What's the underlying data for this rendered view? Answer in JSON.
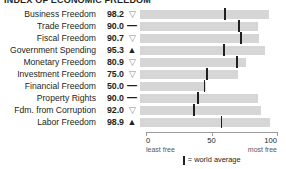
{
  "chart_data": {
    "type": "bar",
    "title": "INDEX OF ECONOMIC FREEDOM",
    "xlabel": "",
    "ylabel": "",
    "xlim": [
      0,
      100
    ],
    "ticks": [
      {
        "value": 0,
        "label": "0",
        "sublabel": "least free"
      },
      {
        "value": 50,
        "label": "50",
        "sublabel": ""
      },
      {
        "value": 100,
        "label": "100",
        "sublabel": "most free"
      }
    ],
    "grid": false,
    "legend_position": "bottom",
    "legend": [
      {
        "marker": "world-average-tick",
        "label": "= world average"
      }
    ],
    "categories": [
      "Business Freedom",
      "Trade Freedom",
      "Fiscal Freedom",
      "Government Spending",
      "Monetary Freedom",
      "Investment Freedom",
      "Financial Freedom",
      "Property Rights",
      "Fdm. from Corruption",
      "Labor Freedom"
    ],
    "values": [
      98.2,
      90.0,
      90.7,
      95.3,
      80.9,
      75.0,
      50.0,
      90.0,
      92.0,
      98.9
    ],
    "world_average": [
      64.5,
      74.8,
      76.5,
      63.7,
      73.4,
      50.6,
      48.5,
      43.6,
      40.5,
      61.5
    ],
    "trends": [
      "down",
      "flat",
      "down",
      "up",
      "down",
      "down",
      "flat",
      "flat",
      "down",
      "up"
    ],
    "colors": {
      "bar": "#d6d6d6",
      "tick": "#231f20",
      "axis": "#9a9a9a",
      "text": "#231f20"
    }
  },
  "glyphs": {
    "up": "▲",
    "down": "▽",
    "flat": "—"
  }
}
